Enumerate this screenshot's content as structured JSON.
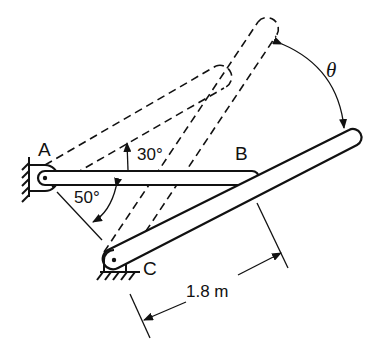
{
  "diagram": {
    "type": "mechanism",
    "points": {
      "A": {
        "label": "A"
      },
      "B": {
        "label": "B"
      },
      "C": {
        "label": "C"
      }
    },
    "angles": {
      "ab_rotation": "30°",
      "ac_angle": "50°",
      "theta": "θ"
    },
    "dimension": {
      "length_label": "1.8 m"
    },
    "colors": {
      "line": "#111111",
      "background": "#ffffff"
    }
  }
}
